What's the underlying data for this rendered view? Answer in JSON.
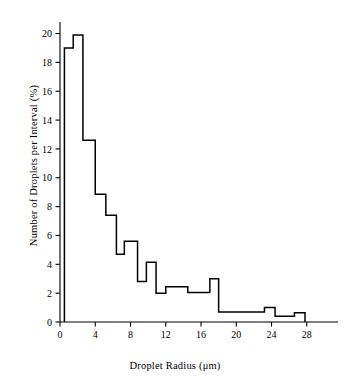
{
  "chart_data": {
    "type": "bar",
    "title": "",
    "xlabel": "Droplet Radius (μm)",
    "ylabel": "Number of Droplets per Interval (%)",
    "xlim": [
      0,
      29.5
    ],
    "ylim": [
      0,
      20.8
    ],
    "xticks": [
      0,
      4,
      8,
      12,
      16,
      20,
      24,
      28
    ],
    "yticks": [
      0,
      2,
      4,
      6,
      8,
      10,
      12,
      14,
      16,
      18,
      20
    ],
    "xtick_labels": [
      "0",
      "4",
      "8",
      "12",
      "16",
      "20",
      "24",
      "28"
    ],
    "ytick_labels": [
      "0",
      "2",
      "4",
      "6",
      "8",
      "10",
      "12",
      "14",
      "16",
      "18",
      "20"
    ],
    "grid": false,
    "legend": null,
    "bin_edges": [
      0.5,
      1.5,
      2.6,
      4.0,
      5.2,
      6.4,
      7.3,
      8.8,
      9.8,
      10.9,
      12.0,
      14.5,
      17.0,
      18.0,
      18.9,
      23.2,
      24.4,
      26.6,
      27.8
    ],
    "values": [
      19.0,
      19.9,
      12.6,
      8.85,
      7.4,
      4.7,
      5.6,
      2.8,
      4.15,
      2.0,
      2.45,
      2.05,
      3.0,
      0.7,
      0.7,
      1.0,
      0.4,
      0.65
    ],
    "categories": [
      "0.5-1.5",
      "1.5-2.6",
      "2.6-4.0",
      "4.0-5.2",
      "5.2-6.4",
      "6.4-7.3",
      "7.3-8.8",
      "8.8-9.8",
      "9.8-10.9",
      "10.9-12.0",
      "12.0-14.5",
      "14.5-17.0",
      "17.0-18.0",
      "18.0-18.9",
      "18.9-23.2",
      "23.2-24.4",
      "24.4-26.6",
      "26.6-27.8"
    ],
    "line_color": "#000000",
    "background_color": "#ffffff"
  },
  "axis": {
    "x_label": "Droplet Radius (μm)",
    "y_label": "Number of Droplets per Interval (%)"
  }
}
